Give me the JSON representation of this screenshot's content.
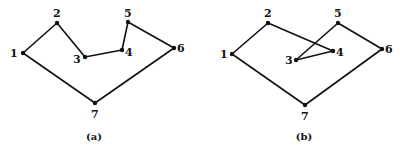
{
  "figures": [
    {
      "caption": "(a)",
      "caption_pos": [
        94,
        140
      ],
      "vertices": [
        {
          "id": "1",
          "label": "1",
          "x": 23,
          "y": 53,
          "lx": 10,
          "ly": 57
        },
        {
          "id": "2",
          "label": "2",
          "x": 57,
          "y": 23,
          "lx": 53,
          "ly": 17
        },
        {
          "id": "3",
          "label": "3",
          "x": 85,
          "y": 57,
          "lx": 73,
          "ly": 63
        },
        {
          "id": "4",
          "label": "4",
          "x": 122,
          "y": 50,
          "lx": 125,
          "ly": 56
        },
        {
          "id": "5",
          "label": "5",
          "x": 128,
          "y": 22,
          "lx": 124,
          "ly": 17
        },
        {
          "id": "6",
          "label": "6",
          "x": 174,
          "y": 48,
          "lx": 177,
          "ly": 52
        },
        {
          "id": "7",
          "label": "7",
          "x": 95,
          "y": 103,
          "lx": 91,
          "ly": 118
        }
      ],
      "edges": [
        [
          "1",
          "2"
        ],
        [
          "2",
          "3"
        ],
        [
          "3",
          "4"
        ],
        [
          "4",
          "5"
        ],
        [
          "5",
          "6"
        ],
        [
          "6",
          "7"
        ],
        [
          "7",
          "1"
        ]
      ]
    },
    {
      "caption": "(b)",
      "caption_pos": [
        304,
        140
      ],
      "vertices": [
        {
          "id": "1",
          "label": "1",
          "x": 232,
          "y": 54,
          "lx": 220,
          "ly": 58
        },
        {
          "id": "2",
          "label": "2",
          "x": 268,
          "y": 23,
          "lx": 264,
          "ly": 17
        },
        {
          "id": "3",
          "label": "3",
          "x": 296,
          "y": 60,
          "lx": 285,
          "ly": 64
        },
        {
          "id": "4",
          "label": "4",
          "x": 333,
          "y": 51,
          "lx": 336,
          "ly": 56
        },
        {
          "id": "5",
          "label": "5",
          "x": 338,
          "y": 23,
          "lx": 334,
          "ly": 17
        },
        {
          "id": "6",
          "label": "6",
          "x": 382,
          "y": 49,
          "lx": 385,
          "ly": 53
        },
        {
          "id": "7",
          "label": "7",
          "x": 305,
          "y": 105,
          "lx": 301,
          "ly": 120
        }
      ],
      "edges": [
        [
          "1",
          "2"
        ],
        [
          "2",
          "4"
        ],
        [
          "4",
          "3"
        ],
        [
          "3",
          "5"
        ],
        [
          "5",
          "6"
        ],
        [
          "6",
          "7"
        ],
        [
          "7",
          "1"
        ]
      ]
    }
  ]
}
